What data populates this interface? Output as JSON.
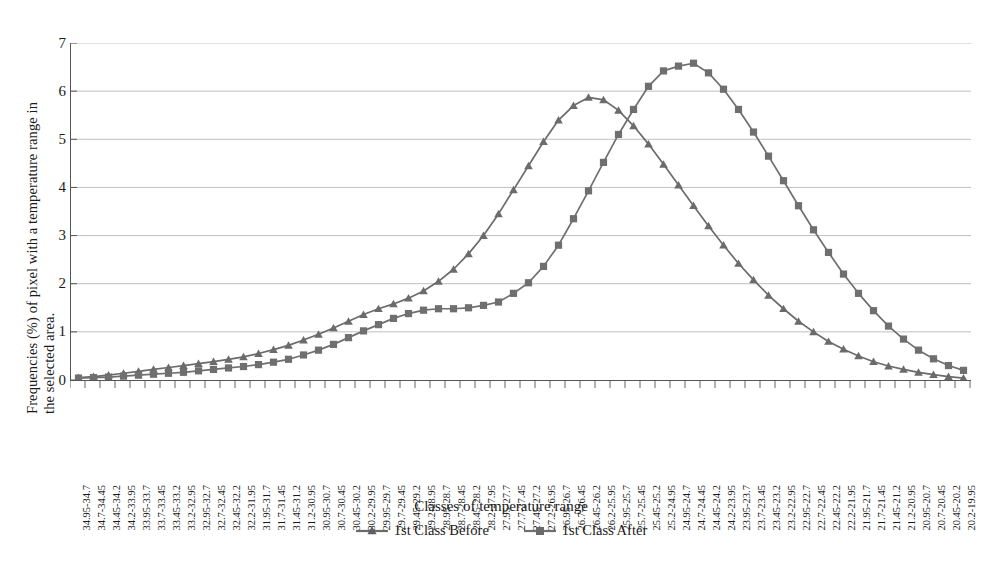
{
  "chart_data": {
    "type": "line",
    "title": "",
    "xlabel": "Classes of temperature range",
    "ylabel": "Frequencies (%) of pixel with a temperature range in the selected area.",
    "ylabel_lines": [
      "Frequencies (%) of pixel with a temperature range in",
      "the selected area."
    ],
    "ylim": [
      0,
      7
    ],
    "yticks": [
      0,
      1,
      2,
      3,
      4,
      5,
      6,
      7
    ],
    "ytick_labels": [
      "0",
      "1",
      "2",
      "3",
      "4",
      "5",
      "6",
      "7"
    ],
    "grid": "horizontal",
    "legend_position": "bottom",
    "categories": [
      "34.95-34.7",
      "34.7-34.45",
      "34.45-34.2",
      "34.2-33.95",
      "33.95-33.7",
      "33.7-33.45",
      "33.45-33.2",
      "33.2-32.95",
      "32.95-32.7",
      "32.7-32.45",
      "32.45-32.2",
      "32.2-31.95",
      "31.95-31.7",
      "31.7-31.45",
      "31.45-31.2",
      "31.2-30.95",
      "30.95-30.7",
      "30.7-30.45",
      "30.45-30.2",
      "30.2-29.95",
      "29.95-29.7",
      "29.7-29.45",
      "29.45-29.2",
      "29.2-28.95",
      "28.95-28.7",
      "28.7-28.45",
      "28.45-28.2",
      "28.2-27.95",
      "27.95-27.7",
      "27.7-27.45",
      "27.45-27.2",
      "27.2-26.95",
      "26.95-26.7",
      "26.7-26.45",
      "26.45-26.2",
      "26.2-25.95",
      "25.95-25.7",
      "25.7-25.45",
      "25.45-25.2",
      "25.2-24.95",
      "24.95-24.7",
      "24.7-24.45",
      "24.45-24.2",
      "24.2-23.95",
      "23.95-23.7",
      "23.7-23.45",
      "23.45-23.2",
      "23.2-22.95",
      "22.95-22.7",
      "22.7-22.45",
      "22.45-22.2",
      "22.2-21.95",
      "21.95-21.7",
      "21.7-21.45",
      "21.45-21.2",
      "21.2-20.95",
      "20.95-20.7",
      "20.7-20.45",
      "20.45-20.2",
      "20.2-19.95"
    ],
    "series": [
      {
        "name": "1st Class Before",
        "marker": "triangle",
        "color": "#6b6b6b",
        "values": [
          0.05,
          0.07,
          0.1,
          0.14,
          0.18,
          0.22,
          0.26,
          0.3,
          0.34,
          0.38,
          0.43,
          0.48,
          0.55,
          0.63,
          0.72,
          0.83,
          0.95,
          1.08,
          1.22,
          1.36,
          1.48,
          1.58,
          1.7,
          1.85,
          2.05,
          2.3,
          2.62,
          3.0,
          3.45,
          3.95,
          4.45,
          4.95,
          5.4,
          5.7,
          5.87,
          5.82,
          5.6,
          5.28,
          4.9,
          4.48,
          4.05,
          3.62,
          3.2,
          2.8,
          2.42,
          2.08,
          1.76,
          1.48,
          1.22,
          1.0,
          0.8,
          0.64,
          0.5,
          0.38,
          0.29,
          0.22,
          0.16,
          0.11,
          0.07,
          0.04
        ]
      },
      {
        "name": "1st Class After",
        "marker": "square",
        "color": "#6f6f6f",
        "values": [
          0.04,
          0.05,
          0.06,
          0.08,
          0.1,
          0.12,
          0.14,
          0.16,
          0.19,
          0.22,
          0.25,
          0.28,
          0.32,
          0.37,
          0.43,
          0.52,
          0.62,
          0.74,
          0.88,
          1.02,
          1.15,
          1.28,
          1.38,
          1.45,
          1.48,
          1.48,
          1.5,
          1.55,
          1.62,
          1.8,
          2.02,
          2.36,
          2.8,
          3.35,
          3.93,
          4.52,
          5.1,
          5.62,
          6.1,
          6.42,
          6.52,
          6.58,
          6.38,
          6.04,
          5.62,
          5.15,
          4.65,
          4.14,
          3.62,
          3.12,
          2.65,
          2.2,
          1.8,
          1.44,
          1.12,
          0.85,
          0.62,
          0.44,
          0.3,
          0.2
        ]
      }
    ]
  },
  "legend": {
    "items": [
      {
        "label": "1st Class Before",
        "marker": "triangle"
      },
      {
        "label": "1st Class After",
        "marker": "square"
      }
    ]
  },
  "axes": {
    "x_title": "Classes of temperature range",
    "y_title_line1": "Frequencies (%) of pixel with a temperature range in",
    "y_title_line2": "the selected area."
  },
  "colors": {
    "series_before": "#6b6b6b",
    "series_after": "#6f6f6f",
    "gridline": "#b9b9b9",
    "axis": "#555555",
    "text": "#1a1a1a",
    "background": "#ffffff"
  }
}
